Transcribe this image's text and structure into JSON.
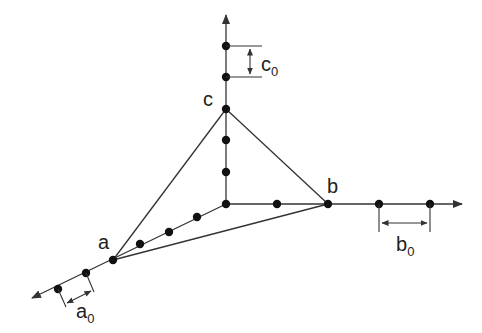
{
  "diagram": {
    "title": "",
    "colors": {
      "line": "#333333",
      "dot": "#111111",
      "text": "#222222",
      "background": "#ffffff"
    },
    "origin": {
      "x": 226,
      "y": 204
    },
    "axes": [
      {
        "name": "a-axis",
        "from": [
          226,
          204
        ],
        "to": [
          32,
          298
        ]
      },
      {
        "name": "b-axis",
        "from": [
          226,
          204
        ],
        "to": [
          462,
          204
        ]
      },
      {
        "name": "c-axis",
        "from": [
          226,
          204
        ],
        "to": [
          226,
          15
        ]
      }
    ],
    "intercepts": {
      "a": {
        "label": "a",
        "x": 113,
        "y": 260
      },
      "b": {
        "label": "b",
        "x": 328,
        "y": 204
      },
      "c": {
        "label": "c",
        "x": 226,
        "y": 109
      }
    },
    "lattice_points": [
      [
        226,
        204
      ],
      [
        277,
        204
      ],
      [
        328,
        204
      ],
      [
        379,
        204
      ],
      [
        430,
        204
      ],
      [
        226,
        172
      ],
      [
        226,
        140
      ],
      [
        226,
        109
      ],
      [
        226,
        77
      ],
      [
        226,
        46
      ],
      [
        197,
        217
      ],
      [
        169,
        232
      ],
      [
        140,
        244
      ],
      [
        113,
        260
      ],
      [
        86,
        273
      ],
      [
        58,
        289
      ]
    ],
    "labels": {
      "a": "a",
      "b": "b",
      "c": "c",
      "a0": "a",
      "a0_sub": "0",
      "b0": "b",
      "b0_sub": "0",
      "c0": "c",
      "c0_sub": "0"
    }
  }
}
